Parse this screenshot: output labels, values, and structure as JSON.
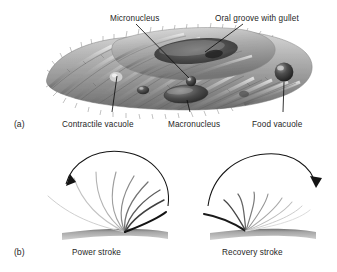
{
  "figure": {
    "background": "#ffffff",
    "text_color": "#262626",
    "leader_color": "#1a1a1a"
  },
  "panel_a": {
    "tag": "(a)",
    "subject": "paramecium-cell",
    "labels": [
      {
        "id": "micronucleus",
        "text": "Micronucleus",
        "x": 110,
        "y": 14,
        "anchor": "start"
      },
      {
        "id": "oral-groove",
        "text": "Oral groove with gullet",
        "x": 215,
        "y": 14,
        "anchor": "start"
      },
      {
        "id": "contractile",
        "text": "Contractile vacuole",
        "x": 62,
        "y": 120,
        "anchor": "start"
      },
      {
        "id": "macronucleus",
        "text": "Macronucleus",
        "x": 168,
        "y": 120,
        "anchor": "start"
      },
      {
        "id": "food-vacuole",
        "text": "Food vacuole",
        "x": 252,
        "y": 120,
        "anchor": "start"
      }
    ],
    "organelles": [
      {
        "id": "micronucleus",
        "shape": "small-dark-sphere"
      },
      {
        "id": "macronucleus",
        "shape": "large-dark-ellipse"
      },
      {
        "id": "food-vacuole",
        "shape": "glossy-dark-sphere"
      },
      {
        "id": "contractile-vacuole",
        "shape": "pale-bulge"
      },
      {
        "id": "oral-groove",
        "shape": "dark-depression"
      }
    ]
  },
  "panel_b": {
    "tag": "(b)",
    "diagrams": [
      {
        "id": "power-stroke",
        "caption": "Power stroke",
        "caption_x": 72,
        "caption_y": 252,
        "arrow_direction": "left",
        "cilia_count": 9,
        "description": "stiff cilia sweeping backward from a common base"
      },
      {
        "id": "recovery-stroke",
        "caption": "Recovery stroke",
        "caption_x": 222,
        "caption_y": 252,
        "arrow_direction": "right",
        "cilia_count": 9,
        "description": "bent cilia returning close to the cell surface"
      }
    ],
    "substrate_color": "#a9a9a9"
  }
}
